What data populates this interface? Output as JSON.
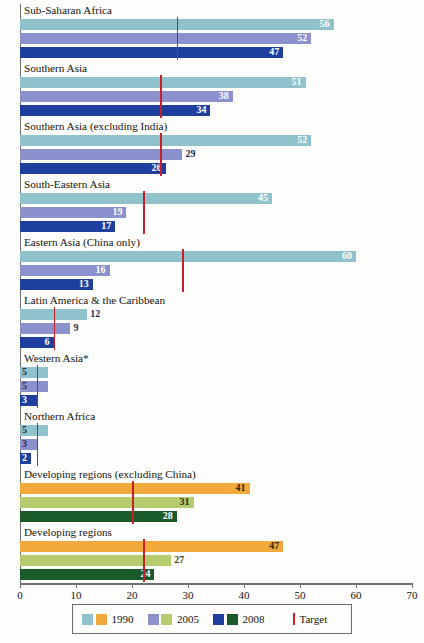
{
  "chart_data": {
    "type": "bar",
    "orientation": "horizontal",
    "title": "",
    "xlabel": "",
    "ylabel": "",
    "xlim": [
      0,
      70
    ],
    "xticks": [
      0,
      10,
      20,
      30,
      40,
      50,
      60,
      70
    ],
    "grid": false,
    "legend_position": "bottom",
    "series": [
      {
        "name": "1990",
        "colors": [
          "#8FC2CA",
          "#F2A93B"
        ]
      },
      {
        "name": "2005",
        "colors": [
          "#8B91CC",
          "#B5CC6E"
        ]
      },
      {
        "name": "2008",
        "colors": [
          "#1F3F9E",
          "#1A5B2A"
        ]
      }
    ],
    "target_legend": "Target",
    "target_color": "#C8202A",
    "categories": [
      "Sub-Saharan Africa",
      "Southern Asia",
      "Southern Asia (excluding India)",
      "South-Eastern Asia",
      "Eastern Asia (China only)",
      "Latin America & the Caribbean",
      "Western Asia*",
      "Northern Africa",
      "Developing regions (excluding China)",
      "Developing regions"
    ],
    "groups": [
      {
        "label": "Sub-Saharan Africa",
        "palette": "cool",
        "target": 28,
        "bars": [
          {
            "year": "1990",
            "value": 56,
            "label": "56",
            "label_pos": "inside"
          },
          {
            "year": "2005",
            "value": 52,
            "label": "52",
            "label_pos": "inside"
          },
          {
            "year": "2008",
            "value": 47,
            "label": "47",
            "label_pos": "inside"
          }
        ]
      },
      {
        "label": "Southern Asia",
        "palette": "cool",
        "target": 25,
        "bars": [
          {
            "year": "1990",
            "value": 51,
            "label": "51",
            "label_pos": "inside"
          },
          {
            "year": "2005",
            "value": 38,
            "label": "38",
            "label_pos": "inside"
          },
          {
            "year": "2008",
            "value": 34,
            "label": "34",
            "label_pos": "inside"
          }
        ]
      },
      {
        "label": "Southern Asia (excluding India)",
        "palette": "cool",
        "target": 25,
        "bars": [
          {
            "year": "1990",
            "value": 52,
            "label": "52",
            "label_pos": "inside"
          },
          {
            "year": "2005",
            "value": 29,
            "label": "29",
            "label_pos": "outside"
          },
          {
            "year": "2008",
            "value": 26,
            "label": "26",
            "label_pos": "inside"
          }
        ]
      },
      {
        "label": "South-Eastern Asia",
        "palette": "cool",
        "target": 22,
        "bars": [
          {
            "year": "1990",
            "value": 45,
            "label": "45",
            "label_pos": "inside"
          },
          {
            "year": "2005",
            "value": 19,
            "label": "19",
            "label_pos": "inside"
          },
          {
            "year": "2008",
            "value": 17,
            "label": "17",
            "label_pos": "inside"
          }
        ]
      },
      {
        "label": "Eastern Asia (China only)",
        "palette": "cool",
        "target": 29,
        "bars": [
          {
            "year": "1990",
            "value": 60,
            "label": "60",
            "label_pos": "inside"
          },
          {
            "year": "2005",
            "value": 16,
            "label": "16",
            "label_pos": "inside"
          },
          {
            "year": "2008",
            "value": 13,
            "label": "13",
            "label_pos": "inside"
          }
        ]
      },
      {
        "label": "Latin America & the Caribbean",
        "palette": "cool",
        "target": 6,
        "bars": [
          {
            "year": "1990",
            "value": 12,
            "label": "12",
            "label_pos": "outside"
          },
          {
            "year": "2005",
            "value": 9,
            "label": "9",
            "label_pos": "outside"
          },
          {
            "year": "2008",
            "value": 6,
            "label": "6",
            "label_pos": "inside"
          }
        ]
      },
      {
        "label": "Western Asia*",
        "palette": "cool",
        "target": 3,
        "bars": [
          {
            "year": "1990",
            "value": 5,
            "label": "5",
            "label_pos": "left"
          },
          {
            "year": "2005",
            "value": 5,
            "label": "5",
            "label_pos": "left"
          },
          {
            "year": "2008",
            "value": 3,
            "label": "3",
            "label_pos": "left"
          }
        ]
      },
      {
        "label": "Northern Africa",
        "palette": "cool",
        "target": 3,
        "bars": [
          {
            "year": "1990",
            "value": 5,
            "label": "5",
            "label_pos": "left"
          },
          {
            "year": "2005",
            "value": 3,
            "label": "3",
            "label_pos": "left"
          },
          {
            "year": "2008",
            "value": 2,
            "label": "2",
            "label_pos": "left"
          }
        ]
      },
      {
        "label": "Developing regions (excluding China)",
        "palette": "warm",
        "target": 20,
        "bars": [
          {
            "year": "1990",
            "value": 41,
            "label": "41",
            "label_pos": "inside"
          },
          {
            "year": "2005",
            "value": 31,
            "label": "31",
            "label_pos": "inside"
          },
          {
            "year": "2008",
            "value": 28,
            "label": "28",
            "label_pos": "inside"
          }
        ]
      },
      {
        "label": "Developing regions",
        "palette": "warm",
        "target": 22,
        "bars": [
          {
            "year": "1990",
            "value": 47,
            "label": "47",
            "label_pos": "inside"
          },
          {
            "year": "2005",
            "value": 27,
            "label": "27",
            "label_pos": "outside"
          },
          {
            "year": "2008",
            "value": 24,
            "label": "24",
            "label_pos": "inside"
          }
        ]
      }
    ]
  },
  "axis": {
    "tick_labels": [
      "0",
      "10",
      "20",
      "30",
      "40",
      "50",
      "60",
      "70"
    ]
  },
  "legend": {
    "items": [
      {
        "label": "1990",
        "swatches": [
          "#8FC2CA",
          "#F2A93B"
        ]
      },
      {
        "label": "2005",
        "swatches": [
          "#8B91CC",
          "#B5CC6E"
        ]
      },
      {
        "label": "2008",
        "swatches": [
          "#1F3F9E",
          "#1A5B2A"
        ]
      }
    ],
    "target_label": "Target",
    "target_color": "#C8202A"
  }
}
